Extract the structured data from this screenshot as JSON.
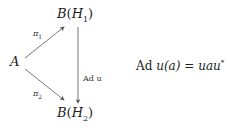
{
  "diagram": {
    "type": "commutative-diagram",
    "nodes": {
      "A": {
        "label": "A"
      },
      "BH1": {
        "script": "B",
        "arg": "H",
        "sub": "1"
      },
      "BH2": {
        "script": "B",
        "arg": "H",
        "sub": "2"
      }
    },
    "arrows": [
      {
        "from": "A",
        "to": "BH1",
        "label": "π",
        "label_sub": "1"
      },
      {
        "from": "A",
        "to": "BH2",
        "label": "π",
        "label_sub": "2"
      },
      {
        "from": "BH1",
        "to": "BH2",
        "label": "Ad u"
      }
    ],
    "equation": {
      "lhs_op": "Ad",
      "lhs": "u(a)",
      "eq": "=",
      "rhs": "uau",
      "rhs_sup": "*"
    },
    "colors": {
      "ink": "#222222",
      "arrow": "#555555",
      "background": "#ffffff"
    }
  }
}
